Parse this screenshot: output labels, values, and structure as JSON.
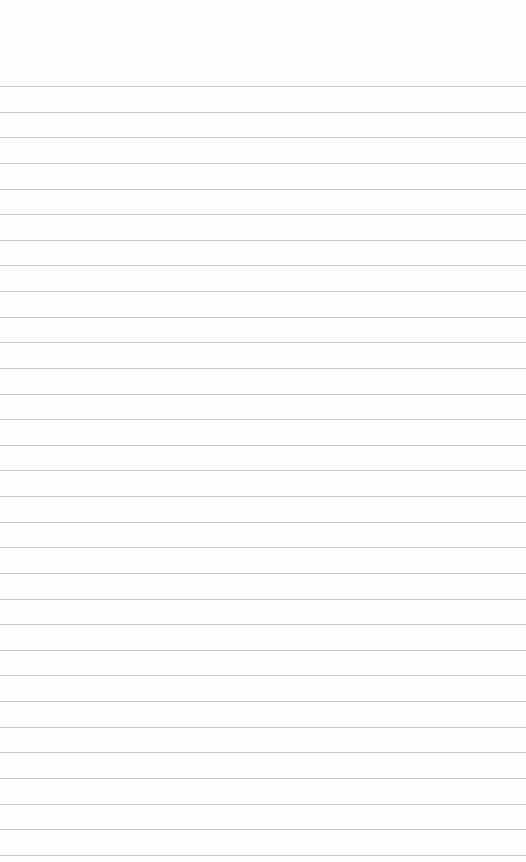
{
  "page": {
    "type": "lined-paper",
    "background_color": "#fefefe",
    "rule_color": "#c9c9c9",
    "first_rule_y": 86,
    "rule_spacing": 25.63,
    "rule_count": 31
  }
}
